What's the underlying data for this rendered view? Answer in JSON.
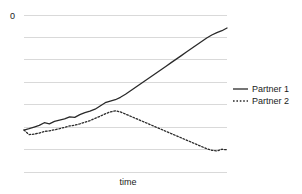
{
  "chart_data": {
    "type": "line",
    "title": "",
    "subtitle": "",
    "xlabel": "time",
    "ylabel": "",
    "grid": true,
    "grid_orientation": "horizontal",
    "gridline_count": 8,
    "legend_position": "right",
    "x": [
      0,
      1,
      2,
      3,
      4,
      5,
      6,
      7,
      8,
      9,
      10,
      11,
      12,
      13,
      14,
      15,
      16,
      17,
      18,
      19,
      20,
      21,
      22,
      23,
      24,
      25,
      26,
      27,
      28,
      29,
      30,
      31,
      32,
      33,
      34,
      35,
      36,
      37,
      38,
      39,
      40
    ],
    "series": [
      {
        "name": "Partner 1",
        "style": "solid",
        "color": "#2a2a2a",
        "values": [
          2.35,
          2.4,
          2.46,
          2.52,
          2.62,
          2.58,
          2.67,
          2.72,
          2.76,
          2.84,
          2.82,
          2.92,
          2.99,
          3.05,
          3.12,
          3.24,
          3.36,
          3.42,
          3.47,
          3.56,
          3.67,
          3.8,
          3.93,
          4.06,
          4.19,
          4.32,
          4.45,
          4.58,
          4.71,
          4.84,
          4.97,
          5.1,
          5.23,
          5.36,
          5.49,
          5.62,
          5.75,
          5.86,
          5.95,
          6.02,
          6.12
        ]
      },
      {
        "name": "Partner 2",
        "style": "dotted",
        "color": "#2a2a2a",
        "values": [
          2.35,
          2.18,
          2.2,
          2.24,
          2.3,
          2.32,
          2.36,
          2.4,
          2.45,
          2.5,
          2.53,
          2.58,
          2.64,
          2.7,
          2.78,
          2.86,
          2.95,
          3.02,
          3.06,
          3.02,
          2.94,
          2.86,
          2.78,
          2.7,
          2.62,
          2.54,
          2.46,
          2.38,
          2.3,
          2.22,
          2.14,
          2.06,
          1.98,
          1.9,
          1.82,
          1.74,
          1.66,
          1.6,
          1.58,
          1.64,
          1.62
        ]
      }
    ],
    "y_tick_labels": [
      "0",
      "",
      "",
      "",
      "",
      "",
      "",
      ""
    ],
    "y_axis_top_label": "0",
    "xlim": [
      0,
      40
    ],
    "ylim": [
      0.8,
      6.6
    ],
    "legend_entries": [
      {
        "label": "Partner 1",
        "style": "solid"
      },
      {
        "label": "Partner 2",
        "style": "dotted"
      }
    ]
  },
  "colors": {
    "background": "#ffffff",
    "gridline": "#d0d0d0",
    "line": "#2a2a2a",
    "text": "#1a1a1a"
  }
}
